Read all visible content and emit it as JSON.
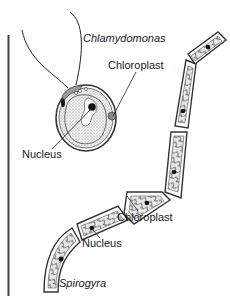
{
  "figure": {
    "organisms": [
      {
        "name": "Chlamydomonas",
        "labels": {
          "name": "Chlamydomonas",
          "chloroplast": "Chloroplast",
          "nucleus": "Nucleus"
        }
      },
      {
        "name": "Spirogyra",
        "labels": {
          "name": "Spirogyra",
          "chloroplast": "Chloroplast",
          "nucleus": "Nucleus"
        }
      }
    ]
  },
  "colors": {
    "ink": "#1a1a1a",
    "stipple": "#bdbdbd",
    "cell_wall": "#555555",
    "divider": "#444444"
  }
}
